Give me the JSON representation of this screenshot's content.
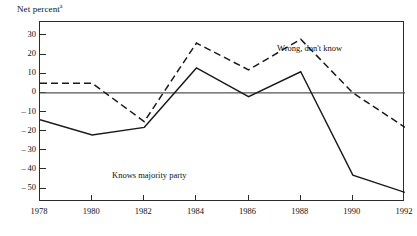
{
  "axis": {
    "y_label": "Net percent",
    "y_label_superscript": "a",
    "y_ticks": [
      "30",
      "20",
      "10",
      "0",
      "-10",
      "-20",
      "-30",
      "-40",
      "-50"
    ],
    "x_ticks": [
      "1978",
      "1980",
      "1982",
      "1984",
      "1986",
      "1988",
      "1990",
      "1992"
    ]
  },
  "annotations": {
    "knows": "Knows majority party",
    "wrong": "Wrong, don't know"
  },
  "chart_data": {
    "type": "line",
    "title": "",
    "xlabel": "",
    "ylabel": "Net percent",
    "ylabel_note": "a",
    "x": [
      1978,
      1980,
      1982,
      1984,
      1986,
      1988,
      1990,
      1992
    ],
    "categories": [
      "1978",
      "1980",
      "1982",
      "1984",
      "1986",
      "1988",
      "1990",
      "1992"
    ],
    "xlim": [
      1978,
      1992
    ],
    "ylim": [
      -57,
      37
    ],
    "yticks": [
      30,
      20,
      10,
      0,
      -10,
      -20,
      -30,
      -40,
      -50
    ],
    "grid": false,
    "zero_line": true,
    "legend": "inline-annotations",
    "series": [
      {
        "name": "Knows majority party",
        "style": "solid",
        "color": "#1a1a1a",
        "values": [
          -14,
          -22,
          -18,
          13,
          -2,
          11,
          -43,
          -52
        ]
      },
      {
        "name": "Wrong, don't know",
        "style": "dashed",
        "color": "#1a1a1a",
        "values": [
          5,
          5,
          -15,
          26,
          12,
          28,
          0,
          -18
        ]
      }
    ]
  }
}
